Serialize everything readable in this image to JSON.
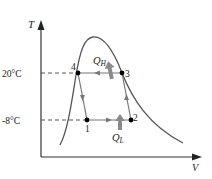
{
  "diagram": {
    "axes": {
      "y_label": "T",
      "x_label": "V"
    },
    "temperatures": {
      "high": "20°C",
      "low": "-8°C"
    },
    "points": [
      {
        "id": "1",
        "label": "1"
      },
      {
        "id": "2",
        "label": "2"
      },
      {
        "id": "3",
        "label": "3"
      },
      {
        "id": "4",
        "label": "4"
      }
    ],
    "heat": {
      "q_high": {
        "symbol": "Q",
        "subscript": "H"
      },
      "q_low": {
        "symbol": "Q",
        "subscript": "L"
      }
    },
    "colors": {
      "axis": "#222222",
      "dome": "#555555",
      "cycle": "#777777",
      "heat_arrow": "#8a8a8a",
      "point": "#000000",
      "dashed": "#444444"
    }
  }
}
